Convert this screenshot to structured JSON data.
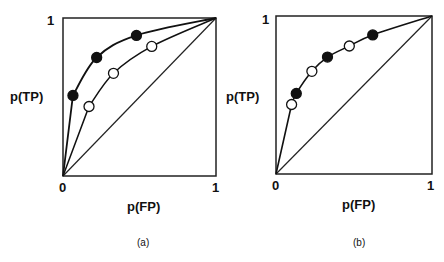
{
  "chart_data": [
    {
      "type": "scatter",
      "panel_label": "(a)",
      "xlabel": "p(FP)",
      "ylabel": "p(TP)",
      "xlim": [
        0,
        1
      ],
      "ylim": [
        0,
        1
      ],
      "x_ticks": [
        "0",
        "1"
      ],
      "y_ticks": [
        "1"
      ],
      "chance_line": true,
      "series": [
        {
          "name": "filled",
          "marker": "filled-circle",
          "points": [
            [
              0.065,
              0.51
            ],
            [
              0.22,
              0.75
            ],
            [
              0.48,
              0.89
            ]
          ]
        },
        {
          "name": "open",
          "marker": "open-circle",
          "points": [
            [
              0.17,
              0.44
            ],
            [
              0.33,
              0.65
            ],
            [
              0.58,
              0.82
            ]
          ]
        }
      ]
    },
    {
      "type": "scatter",
      "panel_label": "(b)",
      "xlabel": "p(FP)",
      "ylabel": "p(TP)",
      "xlim": [
        0,
        1
      ],
      "ylim": [
        0,
        1
      ],
      "x_ticks": [
        "0",
        "1"
      ],
      "y_ticks": [
        "1"
      ],
      "chance_line": true,
      "series": [
        {
          "name": "filled",
          "marker": "filled-circle",
          "points": [
            [
              0.13,
              0.51
            ],
            [
              0.33,
              0.74
            ],
            [
              0.62,
              0.88
            ]
          ]
        },
        {
          "name": "open",
          "marker": "open-circle",
          "points": [
            [
              0.1,
              0.44
            ],
            [
              0.23,
              0.65
            ],
            [
              0.47,
              0.81
            ]
          ]
        }
      ]
    }
  ],
  "panels": [
    {
      "caption": "(a)",
      "xlabel": "p(FP)",
      "ylabel": "p(TP)",
      "tick_zero": "0",
      "tick_one_x": "1",
      "tick_one_y": "1"
    },
    {
      "caption": "(b)",
      "xlabel": "p(FP)",
      "ylabel": "p(TP)",
      "tick_zero": "0",
      "tick_one_x": "1",
      "tick_one_y": "1"
    }
  ]
}
